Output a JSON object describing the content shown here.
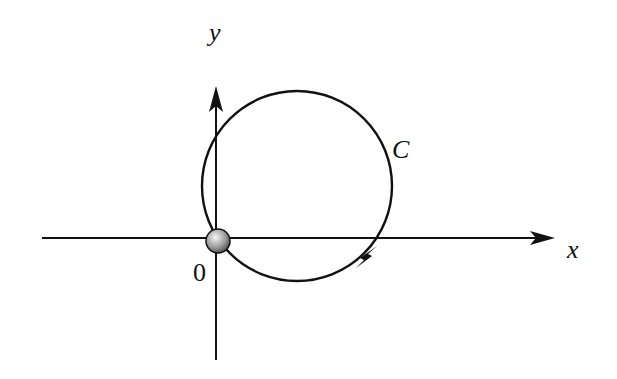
{
  "diagram": {
    "labels": {
      "y_axis": "y",
      "x_axis": "x",
      "curve": "C",
      "origin": "0"
    },
    "circle": {
      "cx": 297,
      "cy": 186,
      "r": 95
    },
    "origin": {
      "x": 217,
      "y": 238
    },
    "colors": {
      "stroke": "#111111",
      "ball_light": "#eeeeee",
      "ball_dark": "#555555"
    }
  }
}
